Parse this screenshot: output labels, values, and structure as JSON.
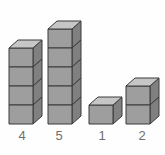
{
  "figure": {
    "title": "",
    "background_color": "#fefefe",
    "width": 165,
    "height": 155
  },
  "chart_data": {
    "type": "bar",
    "title": "",
    "subtitle": "",
    "xlabel": "",
    "ylabel": "",
    "categories": [
      "4",
      "5",
      "1",
      "2"
    ],
    "values": [
      4,
      5,
      1,
      2
    ],
    "value_unit": "cubes",
    "ylim": [
      0,
      5
    ],
    "grid": false,
    "legend": null,
    "render_style": "isometric-cube-stack"
  },
  "stacks": [
    {
      "id": "stack-1",
      "label": "4",
      "cube_count": 4,
      "left": 8,
      "label_left": 10
    },
    {
      "id": "stack-2",
      "label": "5",
      "cube_count": 5,
      "left": 47,
      "label_left": 47
    },
    {
      "id": "stack-3",
      "label": "1",
      "cube_count": 1,
      "left": 88,
      "label_left": 90
    },
    {
      "id": "stack-4",
      "label": "2",
      "cube_count": 2,
      "left": 125,
      "label_left": 130
    }
  ],
  "cube_style": {
    "front_face_color": "#9e9e9e",
    "top_face_color": "#c6c6c6",
    "side_face_color": "#808080",
    "outline_color": "#3a3a3a",
    "front_width": 24,
    "front_height": 19,
    "depth_x": 9,
    "depth_y": 8
  },
  "labels": {
    "text_color": "#6e6e6e",
    "font_size_px": 13
  }
}
